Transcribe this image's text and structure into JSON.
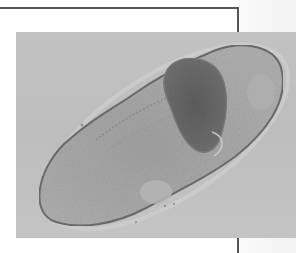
{
  "figure": {
    "colors": {
      "frame_line": "#555555",
      "photo_background": "#c0c0c0",
      "cell_body": "#a8a8a8",
      "cell_outline": "#6e6e6e",
      "inclusion": "#6a6a6a"
    }
  }
}
